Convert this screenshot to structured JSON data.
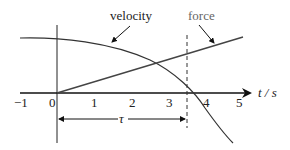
{
  "diagram": {
    "labels": {
      "velocity": "velocity",
      "force": "force",
      "tau": "τ",
      "x_axis": "t / s"
    },
    "x_ticks": [
      "−1",
      "0",
      "1",
      "2",
      "3",
      "4",
      "5"
    ],
    "colors": {
      "curves": "#333333",
      "force_label": "#666666",
      "axis": "#111111"
    },
    "annotations": {
      "dashed_marker_t": 3.5,
      "tau_span": [
        0,
        3.5
      ]
    }
  }
}
